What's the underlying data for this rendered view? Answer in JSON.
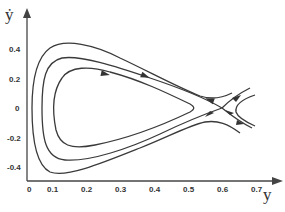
{
  "figure": {
    "x_axis": {
      "label": "y",
      "ticks": [
        "0",
        "0.1",
        "0.2",
        "0.3",
        "0.4",
        "0.5",
        "0.6",
        "0.7"
      ]
    },
    "y_axis": {
      "label": "ẏ",
      "ticks": [
        "0.4",
        "0.2",
        "0",
        "-0.2",
        "-0.4"
      ]
    },
    "features": {
      "center_region": "nested closed orbits around y≈0.25",
      "saddle_point": {
        "y": 0.6,
        "ydot": 0
      },
      "separatrix": "homoclinic loop through saddle",
      "outer_orbit": "open trajectory passing outside the saddle"
    },
    "colors": {
      "line": "#3a3a3a",
      "background": "#ffffff"
    }
  }
}
